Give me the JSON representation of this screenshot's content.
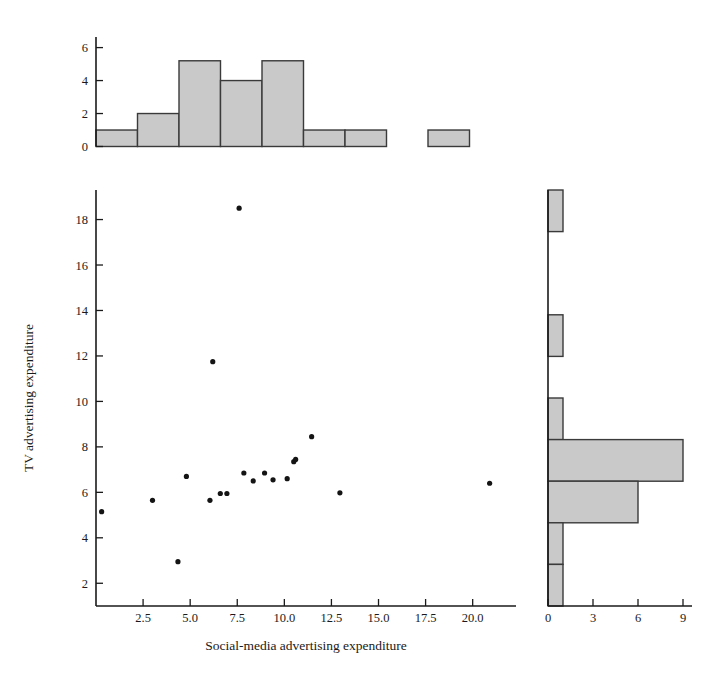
{
  "chart_data": {
    "type": "scatter",
    "title": "",
    "subtitle": "",
    "xlabel": "Social-media advertising expenditure",
    "ylabel": "TV advertising expenditure",
    "xlim": [
      0.0,
      22.3
    ],
    "ylim": [
      1.0,
      19.3
    ],
    "xticks": [
      2.5,
      5.0,
      7.5,
      10.0,
      12.5,
      15.0,
      17.5,
      20.0
    ],
    "xtick_labels": [
      "2.5",
      "5.0",
      "7.5",
      "10.0",
      "12.5",
      "15.0",
      "17.5",
      "20.0"
    ],
    "yticks": [
      2,
      4,
      6,
      8,
      10,
      12,
      14,
      16,
      18
    ],
    "ytick_labels": [
      "2",
      "4",
      "6",
      "8",
      "10",
      "12",
      "14",
      "16",
      "18"
    ],
    "grid": false,
    "legend": "none",
    "marker_color": "#141414",
    "points": [
      {
        "x": 0.3,
        "y": 5.15
      },
      {
        "x": 3.0,
        "y": 5.65
      },
      {
        "x": 4.35,
        "y": 2.95
      },
      {
        "x": 4.8,
        "y": 6.7
      },
      {
        "x": 6.05,
        "y": 5.65
      },
      {
        "x": 6.2,
        "y": 11.75
      },
      {
        "x": 6.6,
        "y": 5.95
      },
      {
        "x": 6.95,
        "y": 5.95
      },
      {
        "x": 7.6,
        "y": 18.5
      },
      {
        "x": 7.85,
        "y": 6.85
      },
      {
        "x": 8.35,
        "y": 6.5
      },
      {
        "x": 8.95,
        "y": 6.85
      },
      {
        "x": 9.4,
        "y": 6.55
      },
      {
        "x": 10.15,
        "y": 6.6
      },
      {
        "x": 10.5,
        "y": 7.35
      },
      {
        "x": 10.6,
        "y": 7.45
      },
      {
        "x": 11.45,
        "y": 8.45
      },
      {
        "x": 12.95,
        "y": 5.98
      },
      {
        "x": 20.9,
        "y": 6.4
      }
    ],
    "marginal_x": {
      "type": "bar",
      "orientation": "vertical",
      "title": "",
      "xlabel": "",
      "ylabel": "",
      "yticks": [
        0,
        2,
        4,
        6
      ],
      "ytick_labels": [
        "0",
        "2",
        "4",
        "6"
      ],
      "ylim": [
        0,
        6.4
      ],
      "bin_edges": [
        0.0,
        2.62,
        5.24,
        7.86,
        10.48,
        13.1,
        15.72,
        18.34,
        20.96
      ],
      "bin_widths_px": 41.5,
      "values": [
        1,
        2,
        5.2,
        4,
        5.2,
        1,
        1,
        0,
        1
      ],
      "bar_fill": "#c9c9c9",
      "bar_edge": "#3a3a3a"
    },
    "marginal_y": {
      "type": "bar",
      "orientation": "horizontal",
      "title": "",
      "xlabel": "",
      "ylabel": "",
      "xticks": [
        0,
        3,
        6,
        9
      ],
      "xtick_labels": [
        "0",
        "3",
        "6",
        "9"
      ],
      "xlim": [
        0,
        9.6
      ],
      "values_top_to_bottom": [
        1,
        0,
        0,
        1,
        0,
        1,
        9,
        6,
        1,
        1
      ],
      "bar_fill": "#c9c9c9",
      "bar_edge": "#3a3a3a"
    }
  }
}
